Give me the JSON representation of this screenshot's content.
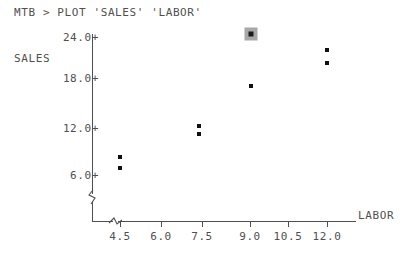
{
  "terminal": {
    "prompt_line": "MTB > PLOT 'SALES' 'LABOR'"
  },
  "axes": {
    "y_title": "SALES",
    "x_title": "LABOR",
    "y_ticks": [
      {
        "label": "24.0+",
        "value": 24.0,
        "y_px": 37
      },
      {
        "label": "18.0+",
        "value": 18.0,
        "y_px": 78
      },
      {
        "label": "12.0+",
        "value": 12.0,
        "y_px": 128
      },
      {
        "label": "6.0+",
        "value": 6.0,
        "y_px": 175
      }
    ],
    "x_ticks": [
      {
        "label": "4.5",
        "value": 4.5,
        "x_px": 120
      },
      {
        "label": "6.0",
        "value": 6.0,
        "x_px": 161
      },
      {
        "label": "7.5",
        "value": 7.5,
        "x_px": 202
      },
      {
        "label": "9.0",
        "value": 9.0,
        "x_px": 250
      },
      {
        "label": "10.5",
        "value": 10.5,
        "x_px": 288
      },
      {
        "label": "12.0",
        "value": 12.0,
        "x_px": 327
      }
    ]
  },
  "chart_data": {
    "type": "scatter",
    "title": "PLOT 'SALES' 'LABOR'",
    "xlabel": "LABOR",
    "ylabel": "SALES",
    "xlim": [
      3.6,
      13.2
    ],
    "ylim": [
      4.0,
      25.0
    ],
    "grid": false,
    "legend": null,
    "points": [
      {
        "x": 4.2,
        "y": 8.1,
        "px": 120,
        "py": 157,
        "selected": false
      },
      {
        "x": 4.2,
        "y": 6.7,
        "px": 120,
        "py": 168,
        "selected": false
      },
      {
        "x": 7.1,
        "y": 12.1,
        "px": 199,
        "py": 126,
        "selected": false
      },
      {
        "x": 7.1,
        "y": 11.2,
        "px": 199,
        "py": 134,
        "selected": false
      },
      {
        "x": 9.0,
        "y": 17.3,
        "px": 251,
        "py": 86,
        "selected": false
      },
      {
        "x": 9.0,
        "y": 24.0,
        "px": 251,
        "py": 34,
        "selected": true
      },
      {
        "x": 12.0,
        "y": 21.9,
        "px": 327,
        "py": 50,
        "selected": false
      },
      {
        "x": 12.0,
        "y": 20.2,
        "px": 327,
        "py": 63,
        "selected": false
      }
    ]
  },
  "colors": {
    "background": "#ffffff",
    "foreground": "#4f4f4f",
    "point": "#101010",
    "selection_highlight": "#a8a8a8"
  }
}
